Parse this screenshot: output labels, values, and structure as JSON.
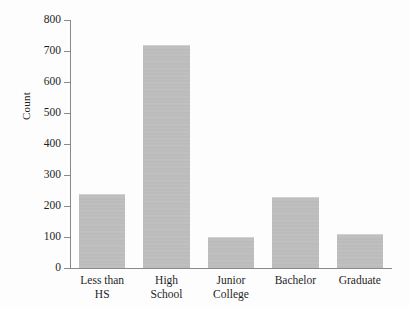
{
  "chart_data": {
    "type": "bar",
    "title": "",
    "subtitle": "",
    "xlabel": "",
    "ylabel": "Count",
    "categories": [
      "Less than HS",
      "High School",
      "Junior College",
      "Bachelor",
      "Graduate"
    ],
    "category_lines": [
      [
        "Less than",
        "HS"
      ],
      [
        "High",
        "School"
      ],
      [
        "Junior",
        "College"
      ],
      [
        "Bachelor"
      ],
      [
        "Graduate"
      ]
    ],
    "values": [
      240,
      720,
      100,
      230,
      110
    ],
    "ylim": [
      0,
      800
    ],
    "ytick_values": [
      0,
      100,
      200,
      300,
      400,
      500,
      600,
      700,
      800
    ],
    "ytick_labels": [
      "0",
      "100",
      "200",
      "300",
      "400",
      "500",
      "600",
      "700",
      "800"
    ],
    "grid": false,
    "legend": null,
    "legend_position": "none",
    "bar_color": "#bfbfbf",
    "axis_color": "#8a8a8a",
    "background_color": "#fdfdfd",
    "text_color": "#1f1f1f"
  }
}
